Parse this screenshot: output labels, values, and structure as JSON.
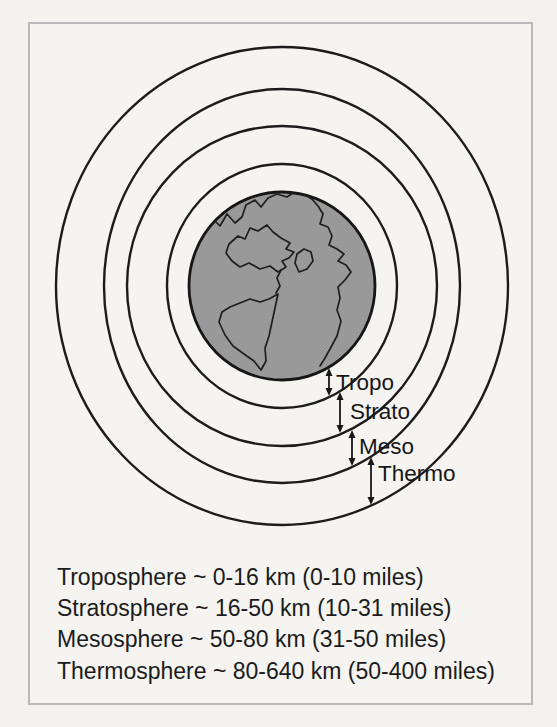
{
  "figure": {
    "type": "earth-atmosphere-layers-diagram"
  },
  "layers": [
    {
      "label": "Tropo",
      "name": "Troposphere",
      "altitude_km": "0-16 km",
      "altitude_miles": "0-10 miles",
      "legend": "Troposphere ~ 0-16 km (0-10 miles)"
    },
    {
      "label": "Strato",
      "name": "Stratosphere",
      "altitude_km": "16-50 km",
      "altitude_miles": "10-31 miles",
      "legend": "Stratosphere ~ 16-50 km (10-31 miles)"
    },
    {
      "label": "Meso",
      "name": "Mesosphere",
      "altitude_km": "50-80 km",
      "altitude_miles": "31-50 miles",
      "legend": "Mesosphere ~ 50-80 km (31-50 miles)"
    },
    {
      "label": "Thermo",
      "name": "Thermosphere",
      "altitude_km": "80-640 km",
      "altitude_miles": "50-400 miles",
      "legend": "Thermosphere ~ 80-640 km (50-400 miles)"
    }
  ],
  "colors": {
    "background": "#f3f2ef",
    "frame_border": "#b9b9b9",
    "line": "#1c1c1c",
    "earth_fill": "#9b9b9b"
  }
}
